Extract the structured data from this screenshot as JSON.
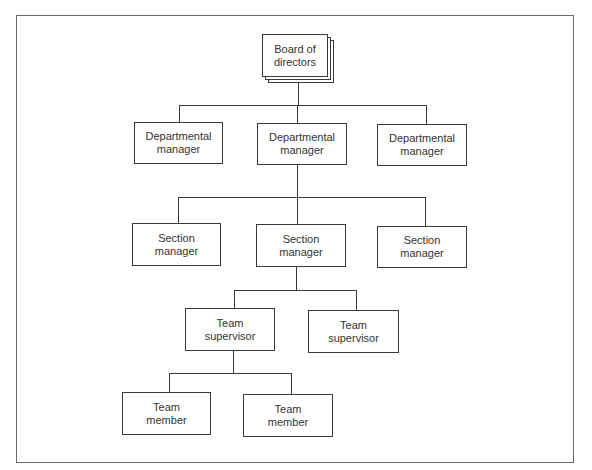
{
  "chart": {
    "type": "organization-chart",
    "levels": [
      {
        "name": "board",
        "nodes": [
          {
            "line1": "Board of",
            "line2": "directors"
          }
        ]
      },
      {
        "name": "departmental",
        "nodes": [
          {
            "line1": "Departmental",
            "line2": "manager"
          },
          {
            "line1": "Departmental",
            "line2": "manager"
          },
          {
            "line1": "Departmental",
            "line2": "manager"
          }
        ]
      },
      {
        "name": "section",
        "nodes": [
          {
            "line1": "Section",
            "line2": "manager"
          },
          {
            "line1": "Section",
            "line2": "manager"
          },
          {
            "line1": "Section",
            "line2": "manager"
          }
        ]
      },
      {
        "name": "team-supervisor",
        "nodes": [
          {
            "line1": "Team",
            "line2": "supervisor"
          },
          {
            "line1": "Team",
            "line2": "supervisor"
          }
        ]
      },
      {
        "name": "team-member",
        "nodes": [
          {
            "line1": "Team",
            "line2": "member"
          },
          {
            "line1": "Team",
            "line2": "member"
          }
        ]
      }
    ]
  },
  "colors": {
    "line": "#3a3a3a",
    "text": "#333333",
    "frame": "#6a6a6a",
    "background": "#ffffff"
  }
}
